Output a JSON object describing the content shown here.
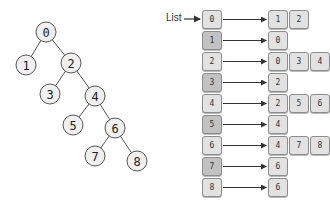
{
  "tree": {
    "nodes": [
      {
        "id": "0",
        "x": 46,
        "y": 32
      },
      {
        "id": "1",
        "x": 26,
        "y": 65
      },
      {
        "id": "2",
        "x": 71,
        "y": 63
      },
      {
        "id": "3",
        "x": 50,
        "y": 94
      },
      {
        "id": "4",
        "x": 95,
        "y": 96
      },
      {
        "id": "5",
        "x": 73,
        "y": 125
      },
      {
        "id": "6",
        "x": 115,
        "y": 128
      },
      {
        "id": "7",
        "x": 95,
        "y": 156
      },
      {
        "id": "8",
        "x": 137,
        "y": 161
      }
    ],
    "edges": [
      [
        "0",
        "1"
      ],
      [
        "0",
        "2"
      ],
      [
        "2",
        "3"
      ],
      [
        "2",
        "4"
      ],
      [
        "4",
        "5"
      ],
      [
        "4",
        "6"
      ],
      [
        "6",
        "7"
      ],
      [
        "6",
        "8"
      ]
    ]
  },
  "adjacency_list": {
    "label": "List",
    "rows": [
      {
        "index": "0",
        "neighbors": [
          "1",
          "2"
        ]
      },
      {
        "index": "1",
        "neighbors": [
          "0"
        ]
      },
      {
        "index": "2",
        "neighbors": [
          "0",
          "3",
          "4"
        ]
      },
      {
        "index": "3",
        "neighbors": [
          "2"
        ]
      },
      {
        "index": "4",
        "neighbors": [
          "2",
          "5",
          "6"
        ]
      },
      {
        "index": "5",
        "neighbors": [
          "4"
        ]
      },
      {
        "index": "6",
        "neighbors": [
          "4",
          "7",
          "8"
        ]
      },
      {
        "index": "7",
        "neighbors": [
          "6"
        ]
      },
      {
        "index": "8",
        "neighbors": [
          "6"
        ]
      }
    ]
  },
  "colors": {
    "box_light": "#e2e2e2",
    "box_dark": "#c2c2c2",
    "line": "#555555"
  }
}
